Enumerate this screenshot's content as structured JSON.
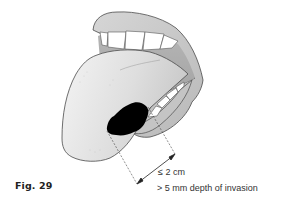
{
  "figure": {
    "label": "Fig. 29",
    "annotations": {
      "size": "≤ 2 cm",
      "depth": "> 5 mm depth of invasion"
    },
    "colors": {
      "lip": "#c8c8c8",
      "mouth_interior": "#a9a9a9",
      "tongue": "#e9e9e9",
      "tumor": "#000000",
      "teeth": "#ffffff",
      "outline": "#4a4a4a"
    }
  }
}
